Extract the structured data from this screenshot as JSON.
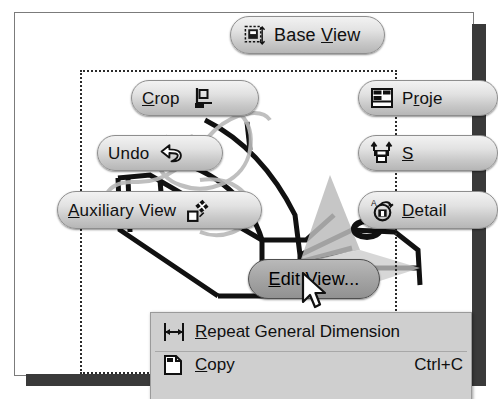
{
  "app": {
    "title": "Autodesk Inventor drawing view marking menu",
    "panel_background": "#ffffff",
    "shadow_color": "#3a3a3a"
  },
  "marking_menu": {
    "name": "drawing-view-marking-menu",
    "selection_rect": {
      "style": "dotted",
      "color": "#2b2b2b"
    },
    "items": [
      {
        "id": "base-view",
        "label": "Base View",
        "accel": "V",
        "icon": "base-view-icon",
        "icon_side": "left",
        "selected": false
      },
      {
        "id": "crop",
        "label": "Crop",
        "accel": "C",
        "icon": "crop-icon",
        "icon_side": "right",
        "selected": false
      },
      {
        "id": "undo",
        "label": "Undo",
        "accel": "",
        "icon": "undo-arrow-icon",
        "icon_side": "right",
        "selected": false
      },
      {
        "id": "auxiliary-view",
        "label": "Auxiliary View",
        "accel": "A",
        "icon": "auxiliary-view-icon",
        "icon_side": "right",
        "selected": false
      },
      {
        "id": "edit-view",
        "label": "Edit View...",
        "accel": "E",
        "icon": "",
        "icon_side": "none",
        "selected": true
      },
      {
        "id": "projected-view",
        "label": "Proje",
        "accel": "r",
        "icon": "projected-view-icon",
        "icon_side": "left",
        "selected": false,
        "clipped": true
      },
      {
        "id": "section-view",
        "label": "S",
        "accel": "S",
        "icon": "section-view-icon",
        "icon_side": "left",
        "selected": false,
        "clipped": true
      },
      {
        "id": "detail-view",
        "label": "Detail",
        "accel": "D",
        "icon": "detail-view-icon",
        "icon_side": "left",
        "selected": false,
        "clipped": true
      }
    ]
  },
  "context_menu": {
    "name": "drawing-context-menu",
    "items": [
      {
        "id": "repeat-general-dimension",
        "label": "Repeat General Dimension",
        "accel": "R",
        "icon": "dimension-icon",
        "shortcut": ""
      },
      {
        "id": "copy",
        "label": "Copy",
        "accel": "C",
        "icon": "copy-icon",
        "shortcut": "Ctrl+C"
      }
    ]
  },
  "cursor": {
    "name": "mouse-pointer",
    "x": 301,
    "y": 272
  }
}
